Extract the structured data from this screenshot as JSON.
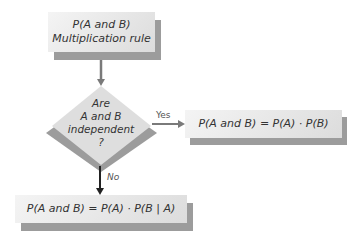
{
  "diagram": {
    "type": "flowchart",
    "start_box": {
      "line1": "P(A and B)",
      "line2": "Multiplication rule"
    },
    "decision": {
      "line1": "Are",
      "line2": "A and B",
      "line3": "independent",
      "line4": "?"
    },
    "yes_branch": {
      "label": "Yes",
      "result": "P(A and B) = P(A) · P(B)"
    },
    "no_branch": {
      "label": "No",
      "result": "P(A and B) = P(A) · P(B | A)"
    },
    "colors": {
      "box_fill": "#e6e6e6",
      "shadow": "#9c9c9c",
      "arrow_gray": "#7a7a7a",
      "arrow_dark": "#222222"
    }
  }
}
